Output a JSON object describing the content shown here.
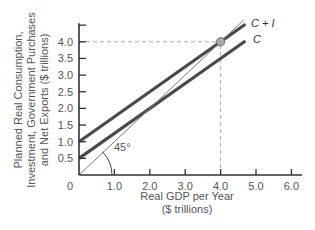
{
  "chart_data": {
    "type": "line",
    "title": "",
    "xlabel": "Real GDP per Year ($ trillions)",
    "xlabel_lines": [
      "Real GDP per Year",
      "($ trillions)"
    ],
    "ylabel": "Planned Real Consumption, Investment, Government Purchases and Net Exports ($ trillions)",
    "ylabel_lines": [
      "Planned Real Consumption,",
      "Investment, Government Purchases",
      "and Net Exports ($ trillions)"
    ],
    "xlim": [
      0,
      6.3
    ],
    "ylim": [
      0,
      4.5
    ],
    "x_ticks": [
      1.0,
      2.0,
      3.0,
      4.0,
      5.0,
      6.0
    ],
    "x_tick_labels": [
      "1.0",
      "2.0",
      "3.0",
      "4.0",
      "5.0",
      "6.0"
    ],
    "origin_label": "0",
    "y_ticks": [
      0.5,
      1.0,
      1.5,
      2.0,
      2.5,
      3.0,
      3.5,
      4.0,
      4.5
    ],
    "y_tick_labels": [
      "0.5",
      "1.0",
      "1.5",
      "2.0",
      "2.5",
      "3.0",
      "3.5",
      "4.0",
      ""
    ],
    "grid": false,
    "series": [
      {
        "name": "C + I",
        "x": [
          0,
          4.7
        ],
        "y": [
          1.0,
          4.525
        ],
        "style": "thick",
        "color": "#4a4a4a"
      },
      {
        "name": "C",
        "x": [
          0,
          4.7
        ],
        "y": [
          0.5,
          4.025
        ],
        "style": "thick",
        "color": "#4a4a4a"
      },
      {
        "name": "45° line",
        "x": [
          0,
          4.65
        ],
        "y": [
          0,
          4.65
        ],
        "style": "thin",
        "color": "#777777"
      }
    ],
    "annotations": [
      {
        "type": "point",
        "x": 4.0,
        "y": 4.0,
        "label": "equilibrium"
      },
      {
        "type": "dashed-guide",
        "from": [
          0,
          4.0
        ],
        "to": [
          4.0,
          4.0
        ]
      },
      {
        "type": "dashed-guide",
        "from": [
          4.0,
          0
        ],
        "to": [
          4.0,
          4.0
        ]
      },
      {
        "type": "angle",
        "label": "45°",
        "at": [
          0,
          0
        ]
      }
    ],
    "legend": "inline labels at line ends"
  }
}
